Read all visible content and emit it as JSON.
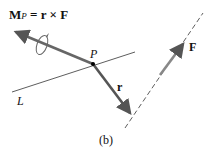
{
  "diagram": {
    "moment_label": {
      "main": "M",
      "sub": "P",
      "rhs": " = r × F"
    },
    "point_label": "P",
    "line_label": "L",
    "position_vector_label": "r",
    "force_label": "F",
    "caption": "(b)",
    "colors": {
      "vector": "#555555",
      "line": "#222222",
      "text": "#111111"
    }
  }
}
